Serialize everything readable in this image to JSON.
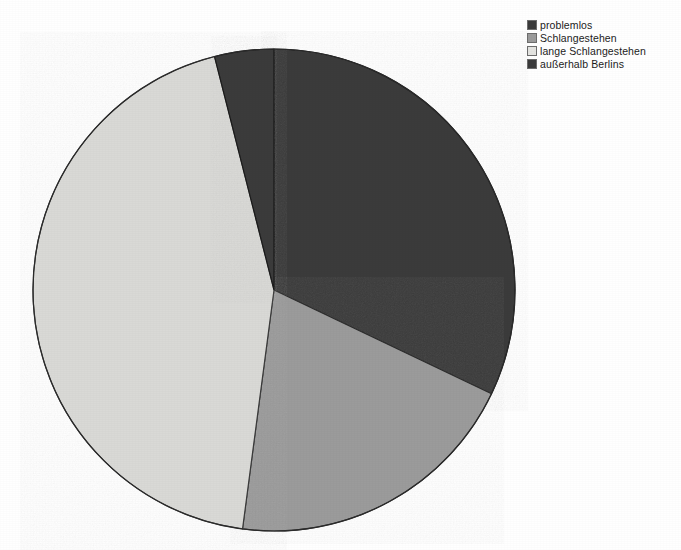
{
  "chart_data": {
    "type": "pie",
    "title": "",
    "subtitle": "",
    "xlabel": "",
    "ylabel": "",
    "legend_position": "top-right",
    "grid": false,
    "start_angle_deg": 0,
    "direction": "clockwise",
    "center": {
      "cx": 274,
      "cy": 290,
      "r": 241
    },
    "categories": [
      "problemlos",
      "Schlangestehen",
      "lange Schlangestehen",
      "außerhalb Berlins"
    ],
    "values": [
      32.1,
      20.0,
      43.9,
      4.0
    ],
    "slices": [
      {
        "label": "problemlos",
        "value": 32.1,
        "start_deg": 0,
        "end_deg": 115.5,
        "color": "#3b3b3b",
        "stroke": "#1a1a1a"
      },
      {
        "label": "Schlangestehen",
        "value": 20.0,
        "start_deg": 115.5,
        "end_deg": 187.5,
        "color": "#9b9b9b",
        "stroke": "#2e2e2e"
      },
      {
        "label": "lange Schlangestehen",
        "value": 43.9,
        "start_deg": 187.5,
        "end_deg": 345.7,
        "color": "#d9d9d6",
        "stroke": "#3a3a3a"
      },
      {
        "label": "außerhalb Berlins",
        "value": 4.0,
        "start_deg": 345.7,
        "end_deg": 360,
        "color": "#3b3b3b",
        "stroke": "#1a1a1a"
      }
    ]
  },
  "legend": {
    "items": [
      {
        "label": "problemlos",
        "color": "#3b3b3b"
      },
      {
        "label": "Schlangestehen",
        "color": "#9b9b9b"
      },
      {
        "label": "lange Schlangestehen",
        "color": "#e4e4e1"
      },
      {
        "label": "außerhalb Berlins",
        "color": "#3b3b3b"
      }
    ]
  },
  "colors": {
    "background": "#ffffff",
    "dark_slice": "#3b3b3b",
    "medium_slice": "#9b9b9b",
    "light_slice": "#d9d9d6",
    "outline": "#2b2b2b",
    "text": "#1c1c1c"
  }
}
